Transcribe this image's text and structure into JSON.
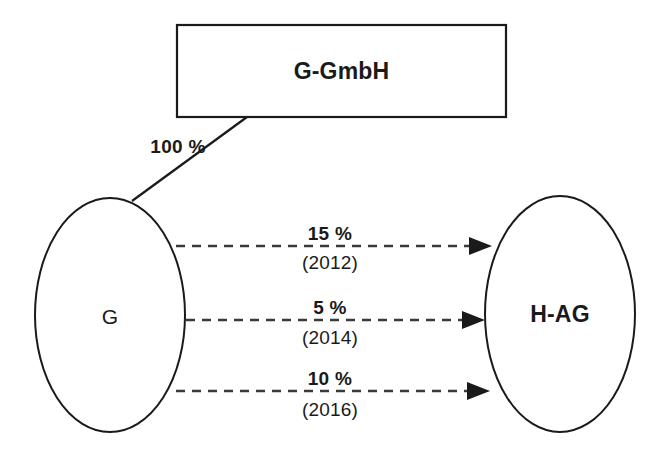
{
  "diagram": {
    "type": "ownership-structure-diagram",
    "background_color": "#ffffff",
    "stroke_color": "#1a1a1a",
    "nodes": [
      {
        "id": "g-gmbh",
        "label": "G-GmbH",
        "shape": "rectangle",
        "x": 177,
        "y": 25,
        "width": 329,
        "height": 92
      },
      {
        "id": "g",
        "label": "G",
        "shape": "ellipse",
        "cx": 110,
        "cy": 315,
        "rx": 75,
        "ry": 117
      },
      {
        "id": "h-ag",
        "label": "H-AG",
        "shape": "ellipse",
        "cx": 560,
        "cy": 314,
        "rx": 75,
        "ry": 118
      }
    ],
    "edges": [
      {
        "id": "edge-100",
        "from": "g-gmbh",
        "to": "g",
        "style": "solid",
        "arrow": false,
        "percent_label": "100 %",
        "year_label": ""
      },
      {
        "id": "edge-15",
        "from": "g",
        "to": "h-ag",
        "style": "dashed",
        "arrow": true,
        "percent_label": "15 %",
        "year_label": "(2012)"
      },
      {
        "id": "edge-5",
        "from": "g",
        "to": "h-ag",
        "style": "dashed",
        "arrow": true,
        "percent_label": "5 %",
        "year_label": "(2014)"
      },
      {
        "id": "edge-10",
        "from": "g",
        "to": "h-ag",
        "style": "dashed",
        "arrow": true,
        "percent_label": "10 %",
        "year_label": "(2016)"
      }
    ]
  }
}
